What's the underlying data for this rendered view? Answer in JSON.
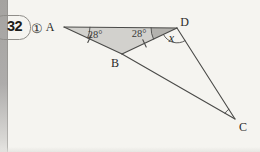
{
  "problem": {
    "number": "32",
    "part": "①"
  },
  "figure": {
    "points": {
      "a": "A",
      "b": "B",
      "c": "C",
      "d": "D"
    },
    "angles": {
      "at_a": "28°",
      "at_d_adb": "28°",
      "x_label": "x"
    },
    "colors": {
      "background": "#f5f4f0",
      "left_bar": "#a9a7a3",
      "triangle_fill": "#d2d1cd",
      "angle_sector_fill": "#b3b2ae",
      "line": "#4a4a48",
      "text": "#2a2a28"
    }
  }
}
